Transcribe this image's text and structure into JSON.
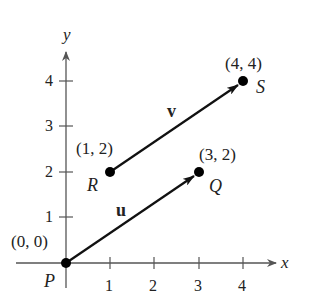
{
  "diagram": {
    "type": "coordinate-plane-vectors",
    "axes": {
      "x_label": "x",
      "y_label": "y",
      "x_ticks": [
        "1",
        "2",
        "3",
        "4"
      ],
      "y_ticks": [
        "1",
        "2",
        "3",
        "4"
      ]
    },
    "points": [
      {
        "name": "P",
        "coords": "(0, 0)",
        "x": 0,
        "y": 0
      },
      {
        "name": "Q",
        "coords": "(3, 2)",
        "x": 3,
        "y": 2
      },
      {
        "name": "R",
        "coords": "(1, 2)",
        "x": 1,
        "y": 2
      },
      {
        "name": "S",
        "coords": "(4, 4)",
        "x": 4,
        "y": 4
      }
    ],
    "vectors": [
      {
        "name": "u",
        "from": "P",
        "to": "Q"
      },
      {
        "name": "v",
        "from": "R",
        "to": "S"
      }
    ],
    "colors": {
      "axis": "#555555",
      "vector": "#111111",
      "point": "#000000",
      "text": "#222222"
    }
  }
}
